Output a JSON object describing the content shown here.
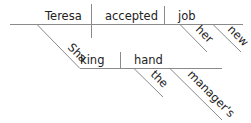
{
  "diagram": {
    "type": "Reed-Kellogg sentence diagram",
    "words": {
      "subject": "Teresa",
      "verb": "accepted",
      "object": "job",
      "object_modifier_1": "her",
      "object_modifier_2": "new",
      "gerund": "Shaking",
      "gerund_object": "hand",
      "gerund_object_modifier_1": "the",
      "gerund_object_modifier_2": "manager's"
    },
    "colors": {
      "line": "#8a8a8a",
      "text": "#222222",
      "background": "#ffffff"
    }
  }
}
